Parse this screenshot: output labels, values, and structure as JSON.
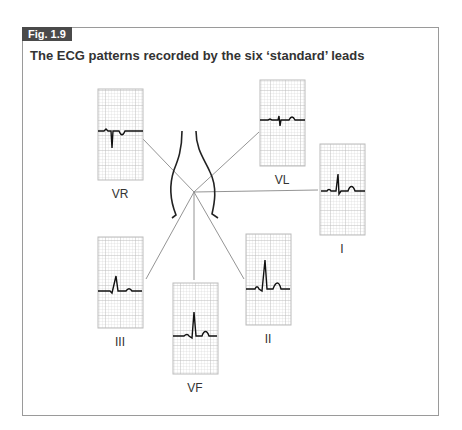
{
  "figure": {
    "badge": "Fig. 1.9",
    "title": "The ECG patterns recorded by the six ‘standard’ leads"
  },
  "leads": [
    {
      "name": "VR",
      "label": "VR"
    },
    {
      "name": "VL",
      "label": "VL"
    },
    {
      "name": "I",
      "label": "I"
    },
    {
      "name": "III",
      "label": "III"
    },
    {
      "name": "VF",
      "label": "VF"
    },
    {
      "name": "II",
      "label": "II"
    }
  ],
  "colors": {
    "grid": "#c8c8c8",
    "trace": "#111111",
    "badge": "#4a4a4a",
    "line": "#888888"
  }
}
